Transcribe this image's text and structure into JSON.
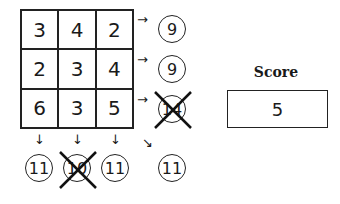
{
  "grid": {
    "rows": [
      [
        "3",
        "4",
        "2"
      ],
      [
        "2",
        "3",
        "4"
      ],
      [
        "6",
        "3",
        "5"
      ]
    ]
  },
  "row_sums": [
    {
      "value": "9",
      "crossed": false
    },
    {
      "value": "9",
      "crossed": false
    },
    {
      "value": "14",
      "crossed": true
    }
  ],
  "col_sums": [
    {
      "value": "11",
      "crossed": false
    },
    {
      "value": "10",
      "crossed": true
    },
    {
      "value": "11",
      "crossed": false
    }
  ],
  "diagonal_sum": {
    "value": "11",
    "crossed": false
  },
  "icons": {
    "arrow_right": "→",
    "arrow_down": "↓",
    "arrow_diag": "↘"
  },
  "score": {
    "label": "Score",
    "value": "5"
  }
}
